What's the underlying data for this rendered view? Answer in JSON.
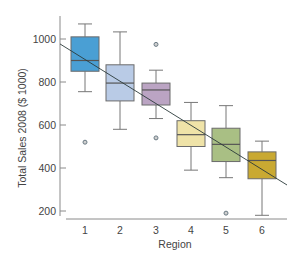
{
  "chart_data": {
    "type": "boxplot",
    "title": "",
    "xlabel": "Region",
    "ylabel": "Total Sales 2008 ($ 1000)",
    "ylim": [
      150,
      1100
    ],
    "yticks": [
      200,
      400,
      600,
      800,
      1000
    ],
    "grid": false,
    "legend": "none",
    "categories": [
      "1",
      "2",
      "3",
      "4",
      "5",
      "6"
    ],
    "boxes": [
      {
        "region": "1",
        "whisker_low": 755,
        "q1": 850,
        "median": 900,
        "q3": 1010,
        "whisker_high": 1070,
        "outliers": [
          520
        ],
        "color": "#4a9fd4"
      },
      {
        "region": "2",
        "whisker_low": 580,
        "q1": 712,
        "median": 795,
        "q3": 880,
        "whisker_high": 1033,
        "outliers": [],
        "color": "#b9cbe6"
      },
      {
        "region": "3",
        "whisker_low": 630,
        "q1": 693,
        "median": 763,
        "q3": 795,
        "whisker_high": 855,
        "outliers": [
          975,
          540
        ],
        "color": "#bba4c3"
      },
      {
        "region": "4",
        "whisker_low": 390,
        "q1": 500,
        "median": 555,
        "q3": 620,
        "whisker_high": 705,
        "outliers": [],
        "color": "#efe3a8"
      },
      {
        "region": "5",
        "whisker_low": 355,
        "q1": 430,
        "median": 510,
        "q3": 585,
        "whisker_high": 690,
        "outliers": [
          190
        ],
        "color": "#a9bf84"
      },
      {
        "region": "6",
        "whisker_low": 180,
        "q1": 350,
        "median": 435,
        "q3": 475,
        "whisker_high": 525,
        "outliers": [],
        "color": "#c9a932"
      }
    ],
    "trend_line": {
      "x_start": 0.5,
      "y_start": 977,
      "x_end": 6.7,
      "y_end": 321
    }
  },
  "axes": {
    "x_title": "Region",
    "y_title": "Total Sales 2008 ($ 1000)"
  }
}
